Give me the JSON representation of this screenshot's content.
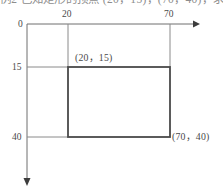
{
  "figure": {
    "caption_fragment": "例2  已知矩形的顶点 (20，15)，(70，40)，求…",
    "background_color": "#ffffff",
    "axis_color": "#6e6e6e",
    "grid_color": "#8a8a8a",
    "rect_color": "#4a4a4a"
  },
  "axes": {
    "origin_label": "0",
    "x_axis": {
      "direction": "right",
      "arrow": true,
      "ticks": [
        {
          "label": "20",
          "value": 20
        },
        {
          "label": "70",
          "value": 70
        }
      ]
    },
    "y_axis": {
      "direction": "down",
      "arrow": true,
      "ticks": [
        {
          "label": "15",
          "value": 15
        },
        {
          "label": "40",
          "value": 40
        }
      ]
    }
  },
  "rectangle": {
    "top_left_label": "(20，15)",
    "bottom_right_label": "(70，40)",
    "x1": 20,
    "y1": 15,
    "x2": 70,
    "y2": 40
  }
}
